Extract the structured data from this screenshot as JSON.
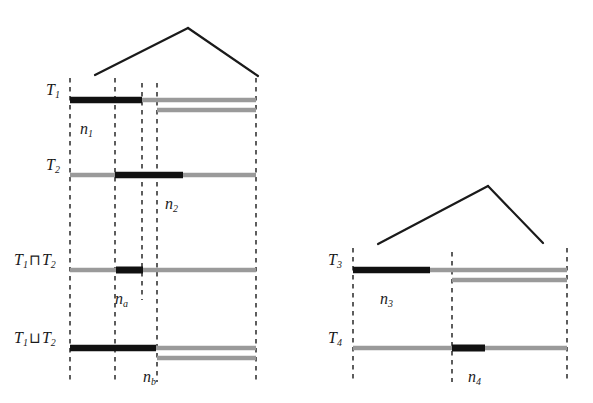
{
  "figure": {
    "background_color": "#ffffff",
    "dark_color": "#111111",
    "light_color": "#9a9a9a",
    "dash_color": "#1a1a1a",
    "groups": [
      {
        "name": "left-group",
        "bracket": {
          "apex_x": 188,
          "apex_y": 28,
          "left_x": 95,
          "left_y": 75,
          "right_x": 258,
          "right_y": 76
        },
        "guides": [
          70,
          115,
          142,
          157,
          256
        ],
        "tracks": [
          {
            "id": "T1",
            "label": "T",
            "label_sub": "1",
            "label_x": 46,
            "label_y": 82,
            "y": 100,
            "rows": [
              {
                "start": 70,
                "end": 256,
                "y": 100,
                "tone": "light"
              },
              {
                "start": 70,
                "end": 142,
                "y": 100,
                "tone": "dark"
              },
              {
                "start": 157,
                "end": 256,
                "y": 110,
                "tone": "light"
              }
            ],
            "segment": {
              "label": "n",
              "label_sub": "1",
              "x": 80,
              "y": 121
            }
          },
          {
            "id": "T2",
            "label": "T",
            "label_sub": "2",
            "label_x": 46,
            "label_y": 157,
            "y": 175,
            "rows": [
              {
                "start": 70,
                "end": 256,
                "y": 175,
                "tone": "light"
              },
              {
                "start": 115,
                "end": 183,
                "y": 175,
                "tone": "dark"
              }
            ],
            "segment": {
              "label": "n",
              "label_sub": "2",
              "x": 165,
              "y": 196
            }
          },
          {
            "id": "T1_meet_T2",
            "label": "T",
            "label_sub": "1",
            "label_op": "⊓",
            "label2": "T",
            "label2_sub": "2",
            "label_x": 14,
            "label_y": 252,
            "y": 270,
            "rows": [
              {
                "start": 70,
                "end": 256,
                "y": 270,
                "tone": "light"
              },
              {
                "start": 116,
                "end": 143,
                "y": 270,
                "tone": "dark"
              }
            ],
            "segment": {
              "label": "n",
              "label_sub": "a",
              "x": 115,
              "y": 291
            }
          },
          {
            "id": "T1_join_T2",
            "label": "T",
            "label_sub": "1",
            "label_op": "⊔",
            "label2": "T",
            "label2_sub": "2",
            "label_x": 14,
            "label_y": 330,
            "y": 348,
            "rows": [
              {
                "start": 70,
                "end": 256,
                "y": 348,
                "tone": "light"
              },
              {
                "start": 70,
                "end": 156,
                "y": 348,
                "tone": "dark"
              },
              {
                "start": 157,
                "end": 256,
                "y": 358,
                "tone": "light"
              }
            ],
            "segment": {
              "label": "n",
              "label_sub": "b",
              "x": 143,
              "y": 369
            }
          }
        ]
      },
      {
        "name": "right-group",
        "bracket": {
          "apex_x": 488,
          "apex_y": 186,
          "left_x": 378,
          "left_y": 244,
          "right_x": 543,
          "right_y": 243
        },
        "guides": [
          353,
          452,
          567
        ],
        "tracks": [
          {
            "id": "T3",
            "label": "T",
            "label_sub": "3",
            "label_x": 328,
            "label_y": 252,
            "y": 270,
            "rows": [
              {
                "start": 353,
                "end": 567,
                "y": 270,
                "tone": "light"
              },
              {
                "start": 353,
                "end": 430,
                "y": 270,
                "tone": "dark"
              },
              {
                "start": 452,
                "end": 567,
                "y": 280,
                "tone": "light"
              }
            ],
            "segment": {
              "label": "n",
              "label_sub": "3",
              "x": 380,
              "y": 291
            }
          },
          {
            "id": "T4",
            "label": "T",
            "label_sub": "4",
            "label_x": 328,
            "label_y": 330,
            "y": 348,
            "rows": [
              {
                "start": 353,
                "end": 567,
                "y": 348,
                "tone": "light"
              },
              {
                "start": 452,
                "end": 485,
                "y": 348,
                "tone": "dark"
              }
            ],
            "segment": {
              "label": "n",
              "label_sub": "4",
              "x": 468,
              "y": 369
            }
          }
        ]
      }
    ],
    "guide_top": 78,
    "guide_bottom": 382
  }
}
